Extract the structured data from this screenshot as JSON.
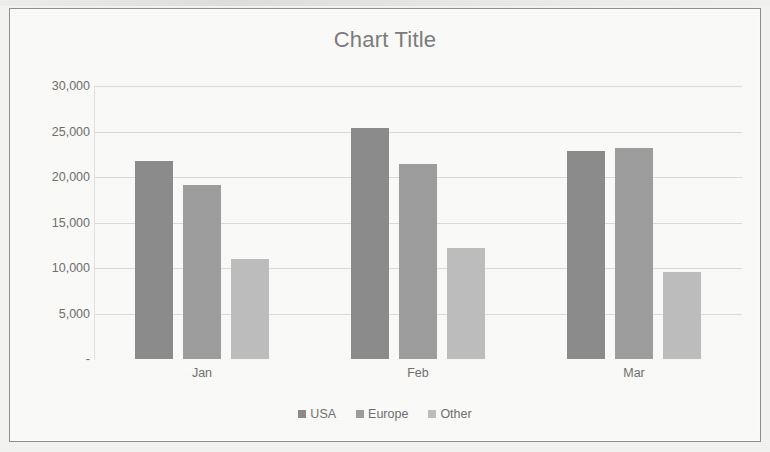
{
  "chart_data": {
    "type": "bar",
    "title": "Chart Title",
    "xlabel": "",
    "ylabel": "",
    "categories": [
      "Jan",
      "Feb",
      "Mar"
    ],
    "series": [
      {
        "name": "USA",
        "color": "#8b8b8b",
        "values": [
          21750,
          25380,
          22860
        ]
      },
      {
        "name": "Europe",
        "color": "#9d9d9d",
        "values": [
          19120,
          21430,
          23190
        ]
      },
      {
        "name": "Other",
        "color": "#bdbdbd",
        "values": [
          10990,
          12200,
          9560
        ]
      }
    ],
    "ylim": [
      0,
      30000
    ],
    "ytick_values": [
      30000,
      25000,
      20000,
      15000,
      10000,
      5000,
      0
    ],
    "ytick_labels": [
      "30,000",
      "25,000",
      "20,000",
      "15,000",
      "10,000",
      "5,000",
      "-"
    ],
    "grid": true,
    "legend_position": "bottom"
  },
  "legend": {
    "items": [
      {
        "label": "USA",
        "swatch": "usa"
      },
      {
        "label": "Europe",
        "swatch": "europe"
      },
      {
        "label": "Other",
        "swatch": "other"
      }
    ]
  }
}
